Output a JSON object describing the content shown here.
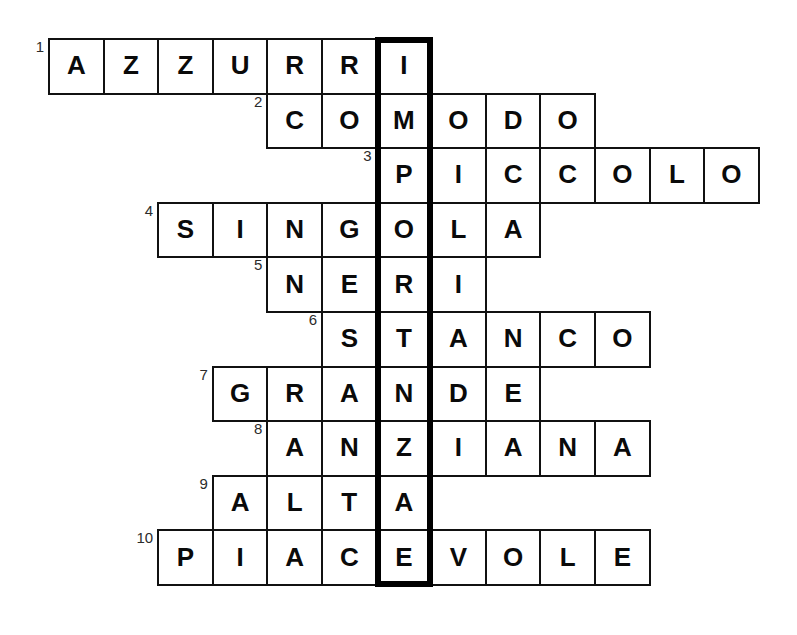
{
  "puzzle": {
    "type": "crossword",
    "language": "Italian",
    "title": "",
    "grid": {
      "origin_x": 48,
      "origin_y": 38,
      "cell_size": 54.6,
      "columns": 13,
      "rows": 10
    },
    "highlight": {
      "column_index": 6,
      "row_start": 0,
      "row_end": 9,
      "answer": "IMPORTANTE",
      "border_color": "#000000",
      "border_width": 6
    },
    "colors": {
      "background": "#ffffff",
      "cell_fill": "#ffffff",
      "cell_border": "#111111",
      "letter": "#0a0a0a",
      "row_number": "#2b2b2b"
    },
    "entries": [
      {
        "number": "1",
        "answer": "AZZURRI",
        "start_col": 0,
        "row": 0,
        "letters": [
          "A",
          "Z",
          "Z",
          "U",
          "R",
          "R",
          "I"
        ]
      },
      {
        "number": "2",
        "answer": "COMODO",
        "start_col": 4,
        "row": 1,
        "letters": [
          "C",
          "O",
          "M",
          "O",
          "D",
          "O"
        ]
      },
      {
        "number": "3",
        "answer": "PICCOLO",
        "start_col": 6,
        "row": 2,
        "letters": [
          "P",
          "I",
          "C",
          "C",
          "O",
          "L",
          "O"
        ]
      },
      {
        "number": "4",
        "answer": "SINGOLA",
        "start_col": 2,
        "row": 3,
        "letters": [
          "S",
          "I",
          "N",
          "G",
          "O",
          "L",
          "A"
        ]
      },
      {
        "number": "5",
        "answer": "NERI",
        "start_col": 4,
        "row": 4,
        "letters": [
          "N",
          "E",
          "R",
          "I"
        ]
      },
      {
        "number": "6",
        "answer": "STANCO",
        "start_col": 5,
        "row": 5,
        "letters": [
          "S",
          "T",
          "A",
          "N",
          "C",
          "O"
        ]
      },
      {
        "number": "7",
        "answer": "GRANDE",
        "start_col": 3,
        "row": 6,
        "letters": [
          "G",
          "R",
          "A",
          "N",
          "D",
          "E"
        ]
      },
      {
        "number": "8",
        "answer": "ANZIANA",
        "start_col": 4,
        "row": 7,
        "letters": [
          "A",
          "N",
          "Z",
          "I",
          "A",
          "N",
          "A"
        ]
      },
      {
        "number": "9",
        "answer": "ALTA",
        "start_col": 3,
        "row": 8,
        "letters": [
          "A",
          "L",
          "T",
          "A"
        ]
      },
      {
        "number": "10",
        "answer": "PIACEVOLE",
        "start_col": 2,
        "row": 9,
        "letters": [
          "P",
          "I",
          "A",
          "C",
          "E",
          "V",
          "O",
          "L",
          "E"
        ]
      }
    ]
  }
}
